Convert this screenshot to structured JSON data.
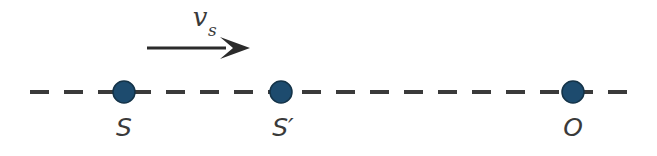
{
  "figure": {
    "background_color": "#ffffff",
    "width": 657,
    "height": 156
  },
  "axis": {
    "name": "dashed-axis-line",
    "color": "#3a3a3a",
    "style": "dashed",
    "y": 92,
    "x_start": 30,
    "x_end": 627,
    "dash_length": 19,
    "gap_length": 15,
    "stroke_width": 4
  },
  "velocity_arrow": {
    "name": "velocity-vector-arrow",
    "color": "#2b2b2b",
    "x_start": 147,
    "x_end": 250,
    "y": 48,
    "shaft_width": 3,
    "label_main": "v",
    "label_subscript": "s",
    "label_x": 200,
    "label_y": 26
  },
  "markers": [
    {
      "name": "marker-source-s",
      "label": "S",
      "x": 124,
      "y": 92,
      "radius": 11,
      "fill": "#1d4b6e",
      "stroke": "#143348",
      "label_x": 124,
      "label_y": 136
    },
    {
      "name": "marker-source-s-prime",
      "label": "S′",
      "x": 281,
      "y": 92,
      "radius": 11,
      "fill": "#1d4b6e",
      "stroke": "#143348",
      "label_x": 283,
      "label_y": 136
    },
    {
      "name": "marker-observer-o",
      "label": "O",
      "x": 573,
      "y": 92,
      "radius": 11,
      "fill": "#1d4b6e",
      "stroke": "#143348",
      "label_x": 573,
      "label_y": 136
    }
  ],
  "colors": {
    "marker_fill": "#1d4b6e",
    "marker_edge": "#143348",
    "line": "#3a3a3a",
    "arrow": "#2b2b2b",
    "text": "#3a3a3a",
    "background": "#ffffff"
  },
  "chart_data": {
    "type": "diagram",
    "xlabel": "",
    "ylabel": "",
    "axis_line": "horizontal dashed line of motion",
    "points": [
      {
        "label": "S",
        "x": 124,
        "description": "original source position"
      },
      {
        "label": "S'",
        "x": 281,
        "description": "displaced source position"
      },
      {
        "label": "O",
        "x": 573,
        "description": "stationary observer position"
      }
    ],
    "vectors": [
      {
        "label": "v_s",
        "x_start": 147,
        "x_end": 250,
        "y": 48,
        "direction": "rightward",
        "description": "source velocity"
      }
    ]
  }
}
